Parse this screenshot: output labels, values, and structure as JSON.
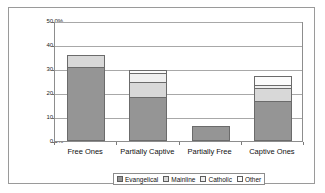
{
  "chart_data": {
    "type": "bar",
    "subtype": "stacked",
    "title": "",
    "xlabel": "",
    "ylabel": "",
    "categories": [
      "Free Ones",
      "Partially Captive",
      "Partially Free",
      "Captive Ones"
    ],
    "series": [
      {
        "name": "Evangelical",
        "color": "#959595",
        "values": [
          30.7,
          18.5,
          6.3,
          16.5
        ]
      },
      {
        "name": "Mainline",
        "color": "#d8d8d8",
        "values": [
          5.3,
          6.0,
          0.0,
          5.5
        ]
      },
      {
        "name": "Catholic",
        "color": "#efefef",
        "values": [
          0.0,
          4.0,
          0.0,
          1.5
        ]
      },
      {
        "name": "Other",
        "color": "#fbfbfb",
        "values": [
          0.0,
          1.0,
          0.0,
          3.5
        ]
      }
    ],
    "totals": [
      36.0,
      29.5,
      6.3,
      27.0
    ],
    "ylim": [
      0,
      50
    ],
    "yticks": [
      0,
      10,
      20,
      30,
      40,
      50
    ],
    "ytick_labels": [
      "0.0%",
      "10.0%",
      "20.0%",
      "30.0%",
      "40.0%",
      "50.0%"
    ],
    "grid": true,
    "grid_axis": "y",
    "legend_position": "bottom",
    "legend_entries": [
      "Evangelical",
      "Mainline",
      "Catholic",
      "Other"
    ]
  },
  "axis": {
    "y_ticks": [
      "50.0%",
      "40.0%",
      "30.0%",
      "20.0%",
      "10.0%",
      "0.0%"
    ]
  }
}
